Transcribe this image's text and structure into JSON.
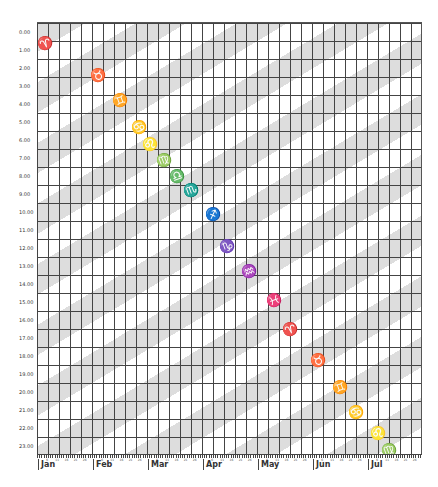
{
  "chart_data": {
    "type": "scatter",
    "title": "",
    "xlabel": "",
    "ylabel": "",
    "x_months": [
      "Jan",
      "Feb",
      "Mar",
      "Apr",
      "May",
      "Jun",
      "Jul"
    ],
    "x_minor_tick_labels": [
      "6",
      "11",
      "16",
      "21",
      "26"
    ],
    "y_ticks": [
      "0.00",
      "1.00",
      "2.00",
      "3.00",
      "4.00",
      "5.00",
      "6.00",
      "7.00",
      "8.00",
      "9.00",
      "10.00",
      "11.00",
      "12.00",
      "13.00",
      "14.00",
      "15.00",
      "16.00",
      "17.00",
      "18.00",
      "19.00",
      "20.00",
      "21.00",
      "22.00",
      "23.00"
    ],
    "ylim": [
      0,
      24
    ],
    "y_inverted": true,
    "grid": true,
    "background_bands": "diagonal alternating grey/white stripes",
    "series": [
      {
        "name": "zodiac-signs",
        "points": [
          {
            "symbol": "♈",
            "name": "Aries",
            "month_pos": 0.15,
            "hour": 1.1
          },
          {
            "symbol": "♉",
            "name": "Taurus",
            "month_pos": 1.1,
            "hour": 2.9
          },
          {
            "symbol": "♊",
            "name": "Gemini",
            "month_pos": 1.5,
            "hour": 4.3
          },
          {
            "symbol": "♋",
            "name": "Cancer",
            "month_pos": 1.85,
            "hour": 5.8
          },
          {
            "symbol": "♌",
            "name": "Leo",
            "month_pos": 2.05,
            "hour": 6.7
          },
          {
            "symbol": "♍",
            "name": "Virgo",
            "month_pos": 2.3,
            "hour": 7.6
          },
          {
            "symbol": "♎",
            "name": "Libra",
            "month_pos": 2.55,
            "hour": 8.5
          },
          {
            "symbol": "♏",
            "name": "Scorpio",
            "month_pos": 2.8,
            "hour": 9.3
          },
          {
            "symbol": "♐",
            "name": "Sagittarius",
            "month_pos": 3.2,
            "hour": 10.6
          },
          {
            "symbol": "♑",
            "name": "Capricorn",
            "month_pos": 3.45,
            "hour": 12.4
          },
          {
            "symbol": "♒",
            "name": "Aquarius",
            "month_pos": 3.85,
            "hour": 13.8
          },
          {
            "symbol": "♓",
            "name": "Pisces",
            "month_pos": 4.3,
            "hour": 15.4
          },
          {
            "symbol": "♈",
            "name": "Aries",
            "month_pos": 4.6,
            "hour": 17.0
          },
          {
            "symbol": "♉",
            "name": "Taurus",
            "month_pos": 5.1,
            "hour": 18.7
          },
          {
            "symbol": "♊",
            "name": "Gemini",
            "month_pos": 5.5,
            "hour": 20.2
          },
          {
            "symbol": "♋",
            "name": "Cancer",
            "month_pos": 5.8,
            "hour": 21.6
          },
          {
            "symbol": "♌",
            "name": "Leo",
            "month_pos": 6.2,
            "hour": 22.8
          },
          {
            "symbol": "♍",
            "name": "Virgo",
            "month_pos": 6.4,
            "hour": 23.7
          }
        ]
      }
    ]
  },
  "colors": {
    "band": "#dddddd",
    "grid": "#444444",
    "glyph": "#1a1a1a"
  }
}
